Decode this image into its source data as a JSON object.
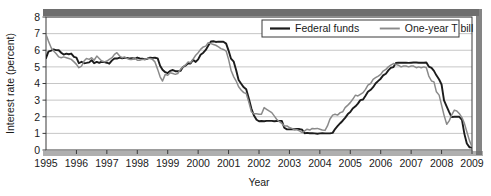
{
  "chart_data": {
    "type": "line",
    "title": "",
    "xlabel": "Year",
    "ylabel": "Interest rate (percent)",
    "xlim": [
      1995,
      2009
    ],
    "ylim": [
      0,
      8
    ],
    "ytick_values": [
      0,
      1,
      2,
      3,
      4,
      5,
      6,
      7,
      8
    ],
    "ytick_labels": [
      "0",
      "1",
      "2",
      "3",
      "4",
      "5",
      "6",
      "7",
      "8"
    ],
    "xtick_values": [
      1995,
      1996,
      1997,
      1998,
      1999,
      2000,
      2001,
      2002,
      2003,
      2004,
      2005,
      2006,
      2007,
      2008,
      2009
    ],
    "xtick_labels": [
      "1995",
      "1996",
      "1997",
      "1998",
      "1999",
      "2000",
      "2001",
      "2002",
      "2003",
      "2004",
      "2005",
      "2006",
      "2007",
      "2008",
      "2009"
    ],
    "grid": "horizontal",
    "legend_position": "top-right",
    "series": [
      {
        "name": "Federal funds",
        "color": "#1c1c1c",
        "x": [
          1995.0,
          1995.08,
          1995.17,
          1995.25,
          1995.33,
          1995.42,
          1995.5,
          1995.58,
          1995.67,
          1995.75,
          1995.83,
          1995.92,
          1996.0,
          1996.08,
          1996.17,
          1996.25,
          1996.33,
          1996.42,
          1996.5,
          1996.58,
          1996.67,
          1996.75,
          1996.83,
          1996.92,
          1997.0,
          1997.08,
          1997.17,
          1997.25,
          1997.33,
          1997.42,
          1997.5,
          1997.58,
          1997.67,
          1997.75,
          1997.83,
          1997.92,
          1998.0,
          1998.08,
          1998.17,
          1998.25,
          1998.33,
          1998.42,
          1998.5,
          1998.58,
          1998.67,
          1998.75,
          1998.83,
          1998.92,
          1999.0,
          1999.08,
          1999.17,
          1999.25,
          1999.33,
          1999.42,
          1999.5,
          1999.58,
          1999.67,
          1999.75,
          1999.83,
          1999.92,
          2000.0,
          2000.08,
          2000.17,
          2000.25,
          2000.33,
          2000.42,
          2000.5,
          2000.58,
          2000.67,
          2000.75,
          2000.83,
          2000.92,
          2001.0,
          2001.08,
          2001.17,
          2001.25,
          2001.33,
          2001.42,
          2001.5,
          2001.58,
          2001.67,
          2001.75,
          2001.83,
          2001.92,
          2002.0,
          2002.08,
          2002.17,
          2002.25,
          2002.33,
          2002.42,
          2002.5,
          2002.58,
          2002.67,
          2002.75,
          2002.83,
          2002.92,
          2003.0,
          2003.08,
          2003.17,
          2003.25,
          2003.33,
          2003.42,
          2003.5,
          2003.58,
          2003.67,
          2003.75,
          2003.83,
          2003.92,
          2004.0,
          2004.08,
          2004.17,
          2004.25,
          2004.33,
          2004.42,
          2004.5,
          2004.58,
          2004.67,
          2004.75,
          2004.83,
          2004.92,
          2005.0,
          2005.08,
          2005.17,
          2005.25,
          2005.33,
          2005.42,
          2005.5,
          2005.58,
          2005.67,
          2005.75,
          2005.83,
          2005.92,
          2006.0,
          2006.08,
          2006.17,
          2006.25,
          2006.33,
          2006.42,
          2006.5,
          2006.58,
          2006.67,
          2006.75,
          2006.83,
          2006.92,
          2007.0,
          2007.08,
          2007.17,
          2007.25,
          2007.33,
          2007.42,
          2007.5,
          2007.58,
          2007.67,
          2007.75,
          2007.83,
          2007.92,
          2008.0,
          2008.08,
          2008.17,
          2008.25,
          2008.33,
          2008.42,
          2008.5,
          2008.58,
          2008.67,
          2008.75,
          2008.83,
          2008.92,
          2009.0
        ],
        "values": [
          5.53,
          5.92,
          5.98,
          6.05,
          6.01,
          6.0,
          5.85,
          5.74,
          5.8,
          5.76,
          5.8,
          5.6,
          5.56,
          5.22,
          5.31,
          5.22,
          5.24,
          5.27,
          5.4,
          5.22,
          5.3,
          5.24,
          5.31,
          5.29,
          5.25,
          5.19,
          5.39,
          5.51,
          5.5,
          5.56,
          5.52,
          5.54,
          5.54,
          5.5,
          5.52,
          5.5,
          5.56,
          5.51,
          5.49,
          5.45,
          5.49,
          5.56,
          5.54,
          5.55,
          5.51,
          5.07,
          4.83,
          4.68,
          4.63,
          4.76,
          4.81,
          4.74,
          4.74,
          4.76,
          4.99,
          5.07,
          5.22,
          5.2,
          5.42,
          5.3,
          5.45,
          5.73,
          5.85,
          6.02,
          6.27,
          6.53,
          6.54,
          6.5,
          6.52,
          6.51,
          6.51,
          6.4,
          5.98,
          5.49,
          5.31,
          4.8,
          4.21,
          3.97,
          3.77,
          3.65,
          3.07,
          2.49,
          2.09,
          1.82,
          1.73,
          1.74,
          1.73,
          1.75,
          1.75,
          1.75,
          1.73,
          1.74,
          1.75,
          1.75,
          1.34,
          1.24,
          1.24,
          1.26,
          1.25,
          1.26,
          1.26,
          1.22,
          1.01,
          1.03,
          1.01,
          1.01,
          1.0,
          0.98,
          1.0,
          1.01,
          1.0,
          1.0,
          1.0,
          1.03,
          1.26,
          1.43,
          1.61,
          1.76,
          1.93,
          2.16,
          2.28,
          2.5,
          2.63,
          2.79,
          3.0,
          3.04,
          3.26,
          3.5,
          3.62,
          3.78,
          4.0,
          4.16,
          4.29,
          4.49,
          4.59,
          4.79,
          4.94,
          4.99,
          5.24,
          5.25,
          5.25,
          5.25,
          5.25,
          5.24,
          5.25,
          5.26,
          5.26,
          5.25,
          5.25,
          5.25,
          5.26,
          5.02,
          4.94,
          4.76,
          4.49,
          4.24,
          3.94,
          2.98,
          2.61,
          2.28,
          1.98,
          2.0,
          2.01,
          2.0,
          1.81,
          0.97,
          0.39,
          0.16,
          0.15
        ]
      },
      {
        "name": "One-year T bill",
        "color": "#8a8a8a",
        "x": [
          1995.0,
          1995.08,
          1995.17,
          1995.25,
          1995.33,
          1995.42,
          1995.5,
          1995.58,
          1995.67,
          1995.75,
          1995.83,
          1995.92,
          1996.0,
          1996.08,
          1996.17,
          1996.25,
          1996.33,
          1996.42,
          1996.5,
          1996.58,
          1996.67,
          1996.75,
          1996.83,
          1996.92,
          1997.0,
          1997.08,
          1997.17,
          1997.25,
          1997.33,
          1997.42,
          1997.5,
          1997.58,
          1997.67,
          1997.75,
          1997.83,
          1997.92,
          1998.0,
          1998.08,
          1998.17,
          1998.25,
          1998.33,
          1998.42,
          1998.5,
          1998.58,
          1998.67,
          1998.75,
          1998.83,
          1998.92,
          1999.0,
          1999.08,
          1999.17,
          1999.25,
          1999.33,
          1999.42,
          1999.5,
          1999.58,
          1999.67,
          1999.75,
          1999.83,
          1999.92,
          2000.0,
          2000.08,
          2000.17,
          2000.25,
          2000.33,
          2000.42,
          2000.5,
          2000.58,
          2000.67,
          2000.75,
          2000.83,
          2000.92,
          2001.0,
          2001.08,
          2001.17,
          2001.25,
          2001.33,
          2001.42,
          2001.5,
          2001.58,
          2001.67,
          2001.75,
          2001.83,
          2001.92,
          2002.0,
          2002.08,
          2002.17,
          2002.25,
          2002.33,
          2002.42,
          2002.5,
          2002.58,
          2002.67,
          2002.75,
          2002.83,
          2002.92,
          2003.0,
          2003.08,
          2003.17,
          2003.25,
          2003.33,
          2003.42,
          2003.5,
          2003.58,
          2003.67,
          2003.75,
          2003.83,
          2003.92,
          2004.0,
          2004.08,
          2004.17,
          2004.25,
          2004.33,
          2004.42,
          2004.5,
          2004.58,
          2004.67,
          2004.75,
          2004.83,
          2004.92,
          2005.0,
          2005.08,
          2005.17,
          2005.25,
          2005.33,
          2005.42,
          2005.5,
          2005.58,
          2005.67,
          2005.75,
          2005.83,
          2005.92,
          2006.0,
          2006.08,
          2006.17,
          2006.25,
          2006.33,
          2006.42,
          2006.5,
          2006.58,
          2006.67,
          2006.75,
          2006.83,
          2006.92,
          2007.0,
          2007.08,
          2007.17,
          2007.25,
          2007.33,
          2007.42,
          2007.5,
          2007.58,
          2007.67,
          2007.75,
          2007.83,
          2007.92,
          2008.0,
          2008.08,
          2008.17,
          2008.25,
          2008.33,
          2008.42,
          2008.5,
          2008.58,
          2008.67,
          2008.75,
          2008.83,
          2008.92,
          2009.0
        ],
        "values": [
          6.95,
          6.55,
          6.15,
          5.95,
          5.8,
          5.6,
          5.55,
          5.6,
          5.55,
          5.5,
          5.45,
          5.3,
          5.15,
          4.95,
          5.05,
          5.35,
          5.5,
          5.45,
          5.55,
          5.4,
          5.65,
          5.5,
          5.35,
          5.3,
          5.35,
          5.45,
          5.55,
          5.75,
          5.85,
          5.65,
          5.55,
          5.6,
          5.5,
          5.45,
          5.45,
          5.55,
          5.4,
          5.4,
          5.45,
          5.45,
          5.5,
          5.5,
          5.45,
          5.3,
          4.85,
          4.4,
          4.15,
          4.55,
          4.5,
          4.65,
          4.6,
          4.55,
          4.6,
          4.85,
          5.0,
          5.1,
          5.3,
          5.25,
          5.45,
          5.7,
          5.85,
          6.05,
          6.2,
          6.25,
          6.45,
          6.4,
          6.35,
          6.3,
          6.2,
          6.1,
          6.05,
          5.95,
          5.45,
          4.8,
          4.4,
          4.15,
          3.8,
          3.6,
          3.45,
          3.4,
          2.85,
          2.3,
          2.18,
          2.18,
          2.15,
          2.15,
          2.55,
          2.45,
          2.35,
          2.25,
          2.05,
          1.85,
          1.7,
          1.6,
          1.45,
          1.45,
          1.35,
          1.3,
          1.22,
          1.22,
          1.15,
          1.05,
          1.15,
          1.25,
          1.2,
          1.3,
          1.28,
          1.3,
          1.25,
          1.2,
          1.18,
          1.45,
          1.85,
          2.1,
          2.15,
          2.1,
          2.25,
          2.3,
          2.55,
          2.7,
          2.85,
          3.05,
          3.3,
          3.25,
          3.35,
          3.45,
          3.65,
          3.9,
          4.0,
          4.25,
          4.35,
          4.45,
          4.55,
          4.75,
          4.85,
          5.0,
          5.1,
          5.2,
          5.15,
          5.1,
          5.0,
          5.05,
          5.05,
          5.0,
          5.05,
          5.05,
          4.95,
          5.0,
          4.95,
          5.0,
          4.95,
          4.45,
          4.15,
          4.1,
          3.5,
          3.3,
          2.7,
          2.1,
          1.55,
          1.75,
          2.1,
          2.4,
          2.35,
          2.2,
          1.95,
          1.6,
          1.1,
          0.55,
          0.2
        ]
      }
    ]
  },
  "legend": {
    "items": [
      {
        "label": "Federal funds",
        "color": "#1c1c1c"
      },
      {
        "label": "One-year T bill",
        "color": "#8a8a8a"
      }
    ]
  },
  "axes": {
    "ylabel": "Interest rate (percent)",
    "xlabel": "Year"
  },
  "style": {
    "plot_border_color": "#3a3a3a",
    "grid_color": "#b8b8b8",
    "top_bar_color": "#6e6e6e",
    "background": "#ffffff"
  }
}
